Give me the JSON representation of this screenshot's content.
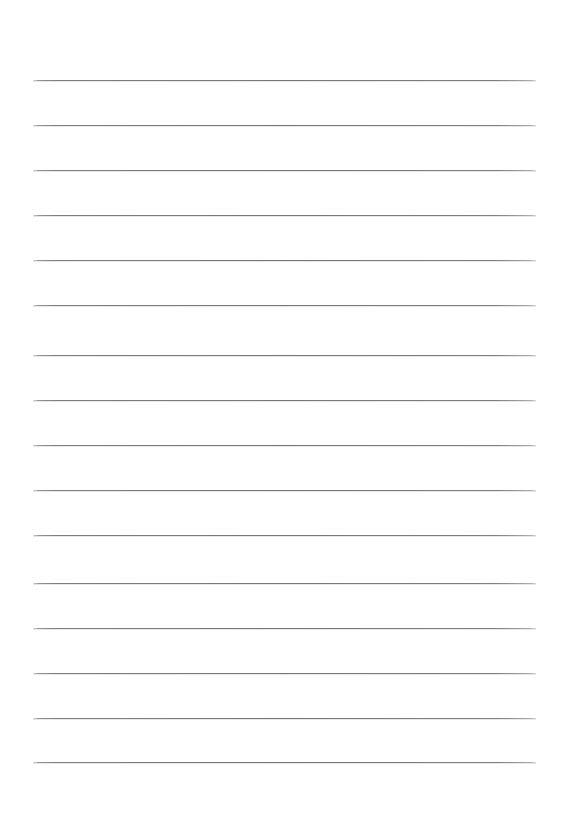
{
  "document": {
    "kind": "scanned-lined-paper",
    "title": "Blank ruled notebook page",
    "page_width": 573,
    "page_height": 828,
    "background_color": "#ffffff",
    "written_text": "",
    "has_handwriting": false,
    "has_printed_text": false
  },
  "ruling": {
    "line_color": "#777779",
    "line_thickness": 1.2,
    "line_count": 16,
    "left_x": 33,
    "right_x": 536,
    "line_width": 503,
    "nominal_spacing": 45,
    "lines": [
      {
        "index": 1,
        "y": 80,
        "x1": 33,
        "x2": 536
      },
      {
        "index": 2,
        "y": 125,
        "x1": 33,
        "x2": 536
      },
      {
        "index": 3,
        "y": 170,
        "x1": 33,
        "x2": 536
      },
      {
        "index": 4,
        "y": 215,
        "x1": 33,
        "x2": 536
      },
      {
        "index": 5,
        "y": 260,
        "x1": 33,
        "x2": 536
      },
      {
        "index": 6,
        "y": 305,
        "x1": 33,
        "x2": 536
      },
      {
        "index": 7,
        "y": 355,
        "x1": 33,
        "x2": 536
      },
      {
        "index": 8,
        "y": 400,
        "x1": 33,
        "x2": 536
      },
      {
        "index": 9,
        "y": 445,
        "x1": 33,
        "x2": 536
      },
      {
        "index": 10,
        "y": 490,
        "x1": 33,
        "x2": 536
      },
      {
        "index": 11,
        "y": 535,
        "x1": 33,
        "x2": 536
      },
      {
        "index": 12,
        "y": 583,
        "x1": 33,
        "x2": 536
      },
      {
        "index": 13,
        "y": 628,
        "x1": 33,
        "x2": 536
      },
      {
        "index": 14,
        "y": 673,
        "x1": 33,
        "x2": 536
      },
      {
        "index": 15,
        "y": 718,
        "x1": 33,
        "x2": 536
      },
      {
        "index": 16,
        "y": 762,
        "x1": 33,
        "x2": 536
      }
    ]
  }
}
